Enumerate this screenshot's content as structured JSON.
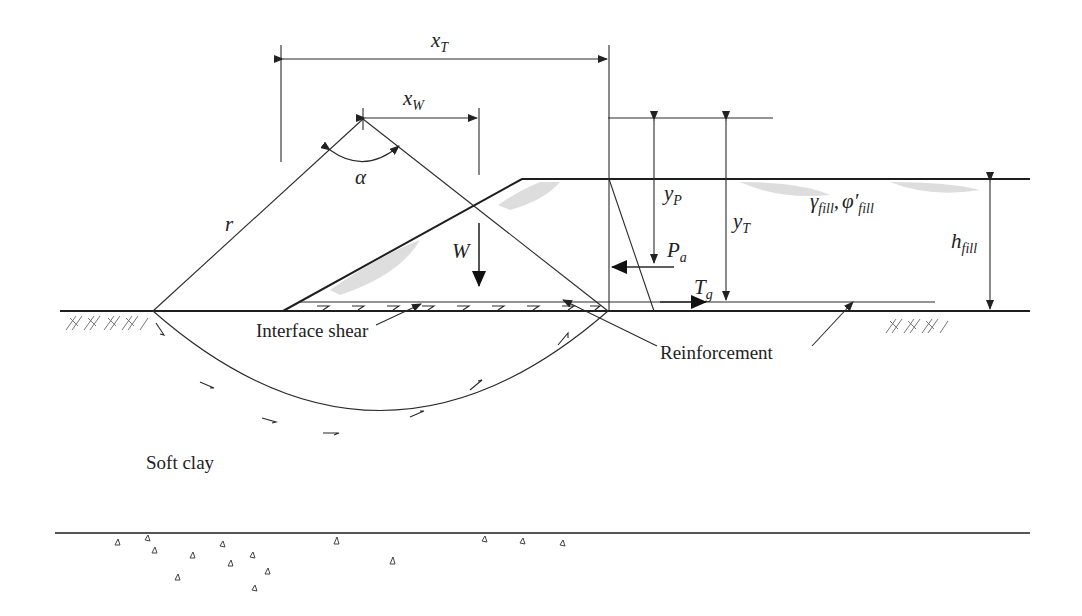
{
  "diagram": {
    "labels": {
      "x_T": {
        "main": "x",
        "sub": "T"
      },
      "x_W": {
        "main": "x",
        "sub": "W"
      },
      "alpha": "α",
      "r": "r",
      "W": "W",
      "y_P": {
        "main": "y",
        "sub": "P"
      },
      "y_T": {
        "main": "y",
        "sub": "T"
      },
      "P_a": {
        "main": "P",
        "sub": "a"
      },
      "T_g": {
        "main": "T",
        "sub": "g"
      },
      "gamma_fill": {
        "main": "γ",
        "sub": "fill"
      },
      "separator": ",",
      "phi_fill": {
        "main": "φ′",
        "sub": "fill"
      },
      "h_fill": {
        "main": "h",
        "sub": "fill"
      },
      "interface_shear": "Interface shear",
      "reinforcement": "Reinforcement",
      "soft_clay": "Soft clay"
    },
    "colors": {
      "line": "#2a2a2a",
      "stipple": "#c8c8c8",
      "hatch": "#777777"
    }
  }
}
